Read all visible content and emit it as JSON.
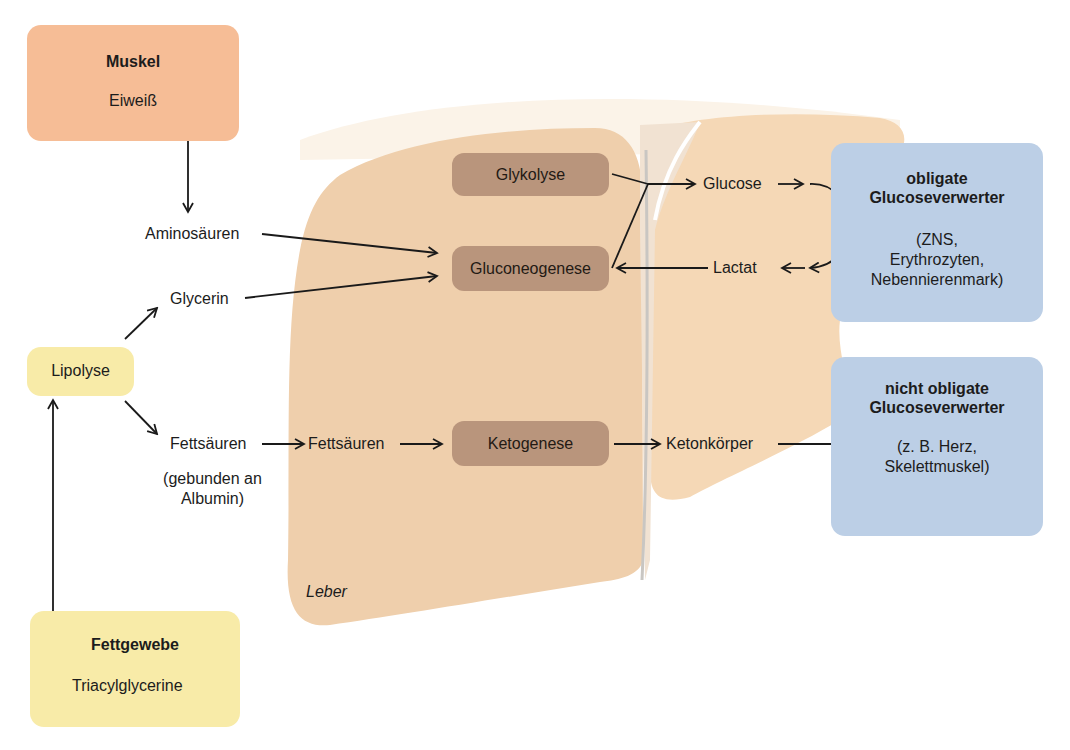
{
  "diagram": {
    "colors": {
      "muskel_box": "#f6bd96",
      "fettgewebe_box": "#f8eba8",
      "lipolyse_box": "#f8eba8",
      "liver": "#f5d9b8",
      "liver_left_lobe": "#efceaa",
      "process_box": "#b9957c",
      "consumer_box": "#bccfe6",
      "arrow": "#1a1a1a"
    },
    "muskel": {
      "title": "Muskel",
      "item": "Eiweiß"
    },
    "fettgewebe": {
      "title": "Fettgewebe",
      "item": "Triacylglycerine"
    },
    "lipolyse": {
      "label": "Lipolyse"
    },
    "intermediates": {
      "aminosaeuren": "Aminosäuren",
      "glycerin": "Glycerin",
      "fettsaeuren_blood": "Fettsäuren",
      "fettsaeuren_note_line1": "(gebunden an",
      "fettsaeuren_note_line2": "Albumin)",
      "fettsaeuren_liver": "Fettsäuren",
      "glucose": "Glucose",
      "lactat": "Lactat",
      "ketonkoerper": "Ketonkörper"
    },
    "liver": {
      "label": "Leber",
      "processes": {
        "glykolyse": "Glykolyse",
        "gluconeogenese": "Gluconeogenese",
        "ketogenese": "Ketogenese"
      }
    },
    "consumers": {
      "obligate": {
        "title_line1": "obligate",
        "title_line2": "Glucoseverwerter",
        "detail_line1": "(ZNS,",
        "detail_line2": "Erythrozyten,",
        "detail_line3": "Nebennierenmark)"
      },
      "nicht_obligate": {
        "title_line1": "nicht obligate",
        "title_line2": "Glucoseverwerter",
        "detail_line1": "(z. B. Herz,",
        "detail_line2": "Skelettmuskel)"
      }
    },
    "arrows": [
      {
        "from": "Eiweiß",
        "to": "Aminosäuren"
      },
      {
        "from": "Aminosäuren",
        "to": "Gluconeogenese"
      },
      {
        "from": "Glycerin",
        "to": "Gluconeogenese"
      },
      {
        "from": "Lipolyse",
        "to": "Glycerin"
      },
      {
        "from": "Lipolyse",
        "to": "Fettsäuren"
      },
      {
        "from": "Triacylglycerine",
        "to": "Lipolyse"
      },
      {
        "from": "Fettsäuren (Blut)",
        "to": "Fettsäuren (Leber)"
      },
      {
        "from": "Fettsäuren (Leber)",
        "to": "Ketogenese"
      },
      {
        "from": "Ketogenese",
        "to": "Ketonkörper"
      },
      {
        "from": "Ketonkörper",
        "to": "nicht obligate Glucoseverwerter"
      },
      {
        "from": "Glykolyse + Gluconeogenese",
        "to": "Glucose"
      },
      {
        "from": "Glucose",
        "to": "obligate Glucoseverwerter"
      },
      {
        "from": "obligate Glucoseverwerter",
        "to": "Lactat"
      },
      {
        "from": "Lactat",
        "to": "Gluconeogenese"
      }
    ]
  }
}
